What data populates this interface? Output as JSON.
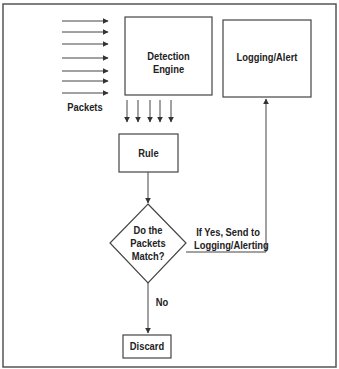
{
  "diagram": {
    "nodes": {
      "detection_engine": "Detection Engine",
      "logging_alert": "Logging/Alert",
      "rule": "Rule",
      "decision_line1": "Do the",
      "decision_line2": "Packets",
      "decision_line3": "Match?",
      "discard": "Discard"
    },
    "labels": {
      "packets": "Packets",
      "yes_line1": "If Yes, Send to",
      "yes_line2": "Logging/Alerting",
      "no": "No"
    },
    "colors": {
      "stroke": "#555555",
      "text": "#222222"
    }
  }
}
